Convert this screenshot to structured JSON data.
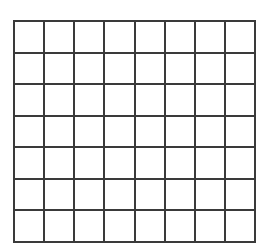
{
  "grid": {
    "rows": 7,
    "cols": 8,
    "line_color": "#3a3a3a",
    "fill_color": "#ffffff"
  }
}
